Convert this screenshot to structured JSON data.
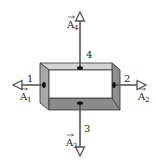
{
  "diagram": {
    "title": "",
    "box": {
      "colors": {
        "left_face": "#a9a9a9",
        "top_face": "#d4d4d4",
        "right_face": "#8e8e8e",
        "bottom_face": "#8a8a8a",
        "opening": "#ffffff",
        "outline": "#333333"
      }
    },
    "faces": [
      {
        "number": "1",
        "vector": "A",
        "subscript": "1",
        "direction": "left"
      },
      {
        "number": "2",
        "vector": "A",
        "subscript": "2",
        "direction": "right"
      },
      {
        "number": "3",
        "vector": "A",
        "subscript": "3",
        "direction": "down"
      },
      {
        "number": "4",
        "vector": "A",
        "subscript": "4",
        "direction": "up"
      }
    ],
    "arrow_color": "#555555"
  }
}
